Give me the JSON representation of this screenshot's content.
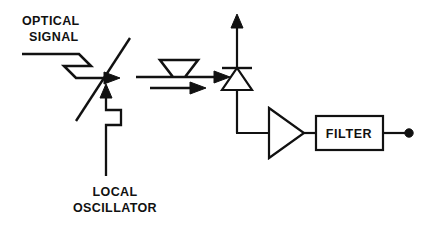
{
  "diagram": {
    "background_color": "#ffffff",
    "line_color": "#111111",
    "labels": {
      "optical_line1": "OPTICAL",
      "optical_line2": "SIGNAL",
      "local_line1": "LOCAL",
      "local_line2": "OSCILLATOR",
      "filter": "FILTER"
    },
    "components": [
      {
        "name": "beam-splitter",
        "type": "diagonal-line",
        "x1": 130,
        "y1": 38,
        "x2": 76,
        "y2": 121
      },
      {
        "name": "photodiode",
        "type": "diode",
        "x": 237,
        "bar_y": 68,
        "top_y": 20,
        "bottom_y": 133
      },
      {
        "name": "amplifier",
        "type": "triangle",
        "left_x": 268,
        "apex_x": 304,
        "center_y": 133,
        "half_height": 25
      },
      {
        "name": "filter-box",
        "type": "rect",
        "x": 316,
        "y": 116,
        "width": 67,
        "height": 34
      },
      {
        "name": "output-terminal",
        "type": "dot",
        "cx": 409,
        "cy": 133,
        "r": 4
      }
    ],
    "signals": [
      {
        "name": "optical-signal-input",
        "type": "zigzag-arrow",
        "direction": "right",
        "points": "22,54 79,54 91,66 64,66 76,78 107,78",
        "arrow_tip_x": 117,
        "arrow_y": 78
      },
      {
        "name": "combined-output-upper",
        "type": "zigzag-arrow",
        "direction": "right",
        "points": "140,73 186,73 199,57 163,57 176,73",
        "arrow_tip_x": 228,
        "arrow_y": 73
      },
      {
        "name": "combined-output-lower",
        "type": "zigzag-arrow",
        "direction": "right",
        "points": "148,82 181,82 193,82",
        "arrow_tip_x": 213,
        "arrow_y": 86
      },
      {
        "name": "local-oscillator-input",
        "type": "zigzag-arrow",
        "direction": "up",
        "shaft_x": 106,
        "bottom_y": 176,
        "arrow_tip_y": 88
      }
    ],
    "wires": [
      {
        "name": "diode-to-amplifier-wire",
        "path": "M 237,68 L 237,133 L 268,133"
      },
      {
        "name": "amplifier-to-filter-wire",
        "path": "M 304,133 L 316,133"
      },
      {
        "name": "filter-to-output-wire",
        "path": "M 383,133 L 406,133"
      },
      {
        "name": "photodiode-output-arrow",
        "path": "M 237,68 L 237,24"
      }
    ]
  }
}
